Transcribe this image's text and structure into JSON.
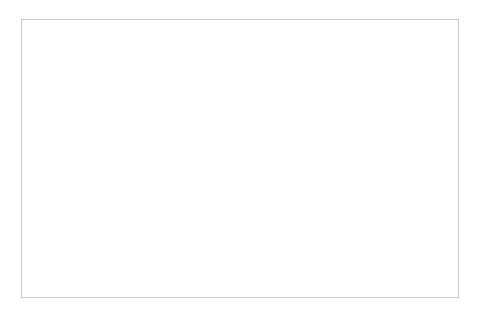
{
  "chart_data": {
    "type": "pie",
    "title": "",
    "subtitle": "",
    "xlabel": "",
    "ylabel": "",
    "legend_position": "none",
    "grid": false,
    "units": "percent",
    "start_angle_deg": 0,
    "direction": "clockwise",
    "categories": [
      "Save",
      "Cross",
      "Through Balls",
      "Dribble and Drive",
      "Thrown Out",
      "Hand Kick",
      "Goal Kick",
      "Free Play"
    ],
    "values": [
      14,
      7,
      4,
      6,
      5,
      21,
      14,
      29
    ],
    "value_labels": [
      "14%",
      "7%",
      "4%",
      "6%",
      "5%",
      "21%",
      "14%",
      "29%"
    ],
    "colors": [
      "#6e6e6e",
      "#a8a8a8",
      "#8a8a8a",
      "#5a5a5a",
      "#9b9b9b",
      "#c2c2c2",
      "#b0b0b0",
      "#c9c9c9"
    ],
    "slices": [
      {
        "name": "Save",
        "value": 14,
        "value_label": "14%",
        "color": "#6e6e6e",
        "label_placement": "inside"
      },
      {
        "name": "Cross",
        "value": 7,
        "value_label": "7%",
        "color": "#a8a8a8",
        "label_placement": "inside"
      },
      {
        "name": "Through Balls",
        "value": 4,
        "value_label": "4%",
        "color": "#8a8a8a",
        "label_placement": "outside"
      },
      {
        "name": "Dribble and Drive",
        "value": 6,
        "value_label": "6%",
        "color": "#5a5a5a",
        "label_placement": "outside"
      },
      {
        "name": "Thrown Out",
        "value": 5,
        "value_label": "5%",
        "color": "#9b9b9b",
        "label_placement": "outside"
      },
      {
        "name": "Hand Kick",
        "value": 21,
        "value_label": "21%",
        "color": "#c2c2c2",
        "label_placement": "inside"
      },
      {
        "name": "Goal Kick",
        "value": 14,
        "value_label": "14%",
        "color": "#b0b0b0",
        "label_placement": "inside"
      },
      {
        "name": "Free Play",
        "value": 29,
        "value_label": "29%",
        "color": "#c9c9c9",
        "label_placement": "inside"
      }
    ],
    "geometry": {
      "center_x": 239,
      "center_y": 160,
      "radius": 113
    },
    "frame": {
      "border_color": "#c6c6c6",
      "background": "#ffffff"
    }
  }
}
